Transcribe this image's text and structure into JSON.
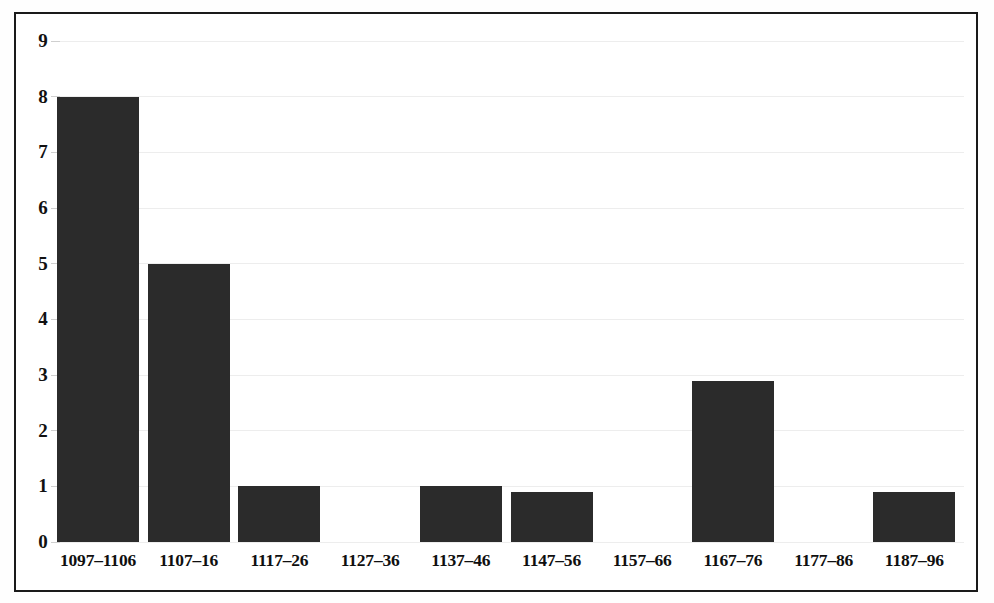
{
  "chart_data": {
    "type": "bar",
    "title": "",
    "subtitle": "",
    "xlabel": "",
    "ylabel": "",
    "categories": [
      "1097–1106",
      "1107–16",
      "1117–26",
      "1127–36",
      "1137–46",
      "1147–56",
      "1157–66",
      "1167–76",
      "1177–86",
      "1187–96"
    ],
    "values": [
      8,
      5,
      1,
      0,
      1,
      0.9,
      0,
      2.9,
      0,
      0.9
    ],
    "ylim": [
      0,
      9
    ],
    "ytick_labels": [
      "0",
      "1",
      "2",
      "3",
      "4",
      "5",
      "6",
      "7",
      "8",
      "9"
    ],
    "ytick_values": [
      0,
      1,
      2,
      3,
      4,
      5,
      6,
      7,
      8,
      9
    ],
    "grid": true,
    "grid_axis": "y",
    "legend": false,
    "legend_position": "none",
    "bar_color": "#2b2b2b",
    "grid_color": "#ededed",
    "background_color": "#ffffff",
    "border_color": "#1a1a1a",
    "axis_label_color": "#111111"
  }
}
